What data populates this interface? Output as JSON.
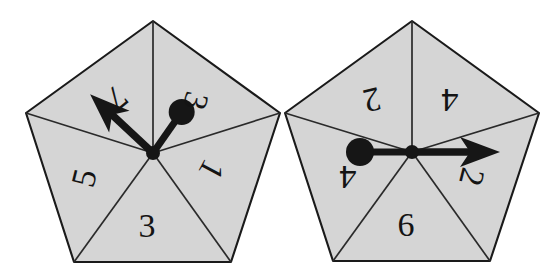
{
  "figure": {
    "type": "diagram",
    "canvas": {
      "width": 560,
      "height": 278
    },
    "colors": {
      "background": "#ffffff",
      "pentagon_fill": "#d5d5d5",
      "pentagon_stroke": "#1a1a1a",
      "spoke_stroke": "#2a2a2a",
      "marker_fill": "#161616",
      "label_fill": "#141414"
    }
  },
  "pentagons": [
    {
      "name": "left-pentagon",
      "center": {
        "x": 153,
        "y": 153
      },
      "radius": 134,
      "apex_angle_deg": -90,
      "vertices": [
        {
          "x": 153,
          "y": 21
        },
        {
          "x": 280,
          "y": 113
        },
        {
          "x": 231,
          "y": 262
        },
        {
          "x": 74,
          "y": 262
        },
        {
          "x": 26,
          "y": 113
        }
      ],
      "arrow": {
        "name": "arrow-indicator",
        "angle_deg": 137,
        "length": 86,
        "label": "7"
      },
      "dot": {
        "name": "dot-indicator",
        "angle_deg": -55,
        "distance": 50,
        "radius": 13,
        "label": "1"
      },
      "sectors": [
        {
          "id": "left-sector-ne",
          "label": "3",
          "rotation_deg": 104,
          "lx": 196,
          "ly": 101
        },
        {
          "id": "left-sector-e",
          "label": "1",
          "rotation_deg": 118,
          "lx": 212,
          "ly": 170
        },
        {
          "id": "left-sector-s",
          "label": "3",
          "rotation_deg": 0,
          "lx": 147,
          "ly": 225
        },
        {
          "id": "left-sector-w",
          "label": "5",
          "rotation_deg": 284,
          "lx": 84,
          "ly": 178
        },
        {
          "id": "left-sector-nw",
          "label": "7",
          "rotation_deg": 140,
          "lx": 117,
          "ly": 98
        }
      ]
    },
    {
      "name": "right-pentagon",
      "center": {
        "x": 412,
        "y": 152
      },
      "radius": 134,
      "apex_angle_deg": -90,
      "vertices": [
        {
          "x": 412,
          "y": 21
        },
        {
          "x": 539,
          "y": 113
        },
        {
          "x": 490,
          "y": 261
        },
        {
          "x": 333,
          "y": 261
        },
        {
          "x": 285,
          "y": 113
        }
      ],
      "arrow": {
        "name": "arrow-indicator",
        "angle_deg": 0,
        "length": 88,
        "label": "2"
      },
      "dot": {
        "name": "dot-indicator",
        "angle_deg": 180,
        "distance": 52,
        "radius": 14,
        "label": "4"
      },
      "sectors": [
        {
          "id": "right-sector-ne",
          "label": "4",
          "rotation_deg": 180,
          "lx": 450,
          "ly": 100
        },
        {
          "id": "right-sector-e",
          "label": "2",
          "rotation_deg": 104,
          "lx": 472,
          "ly": 177
        },
        {
          "id": "right-sector-s",
          "label": "6",
          "rotation_deg": 0,
          "lx": 406,
          "ly": 224
        },
        {
          "id": "right-sector-w",
          "label": "4",
          "rotation_deg": 180,
          "lx": 348,
          "ly": 177
        },
        {
          "id": "right-sector-nw",
          "label": "2",
          "rotation_deg": 167,
          "lx": 372,
          "ly": 100
        }
      ]
    }
  ]
}
